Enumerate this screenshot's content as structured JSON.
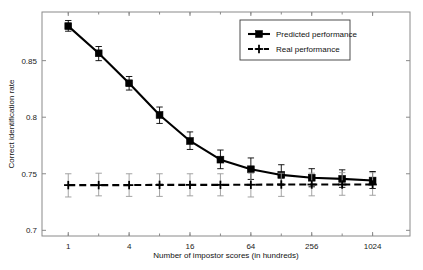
{
  "chart_data": {
    "type": "line",
    "title": "",
    "xlabel": "Number of impostor scores (in hundreds)",
    "ylabel": "Correct identification rate",
    "x_scale": "log2",
    "x": [
      1,
      2,
      4,
      8,
      16,
      32,
      64,
      128,
      256,
      512,
      1024
    ],
    "xticks": [
      1,
      4,
      16,
      64,
      256,
      1024
    ],
    "xticklabels": [
      "1",
      "4",
      "16",
      "64",
      "256",
      "1024"
    ],
    "yticks": [
      0.7,
      0.75,
      0.8,
      0.85
    ],
    "yticklabels": [
      "0.7",
      "0.75",
      "0.8",
      "0.85"
    ],
    "ylim": [
      0.695,
      0.893
    ],
    "xlim": [
      0.55,
      2400
    ],
    "grid": false,
    "legend_position": "top-right",
    "series": [
      {
        "name": "Predicted performance",
        "marker": "square",
        "linestyle": "solid",
        "color": "#000000",
        "values": [
          0.8805,
          0.8565,
          0.83,
          0.802,
          0.779,
          0.7625,
          0.754,
          0.749,
          0.7465,
          0.7455,
          0.744
        ],
        "err_low": [
          0.876,
          0.85,
          0.824,
          0.7945,
          0.7715,
          0.7545,
          0.745,
          0.74,
          0.7385,
          0.738,
          0.737
        ],
        "err_high": [
          0.8855,
          0.8625,
          0.836,
          0.809,
          0.787,
          0.771,
          0.764,
          0.758,
          0.7545,
          0.7535,
          0.752
        ]
      },
      {
        "name": "Real performance",
        "marker": "plus",
        "linestyle": "dashed",
        "color": "#000000",
        "values": [
          0.74,
          0.74,
          0.74,
          0.7402,
          0.7402,
          0.7402,
          0.7403,
          0.7405,
          0.7405,
          0.7405,
          0.7405
        ],
        "err_low": [
          0.7295,
          0.7305,
          0.73,
          0.73,
          0.7305,
          0.7305,
          0.7295,
          0.73,
          0.7305,
          0.731,
          0.731
        ],
        "err_high": [
          0.75,
          0.7505,
          0.75,
          0.75,
          0.75,
          0.75,
          0.7505,
          0.7505,
          0.7505,
          0.751,
          0.751
        ]
      }
    ]
  },
  "legend": {
    "entries": [
      {
        "label": "Predicted performance"
      },
      {
        "label": "Real performance"
      }
    ]
  }
}
